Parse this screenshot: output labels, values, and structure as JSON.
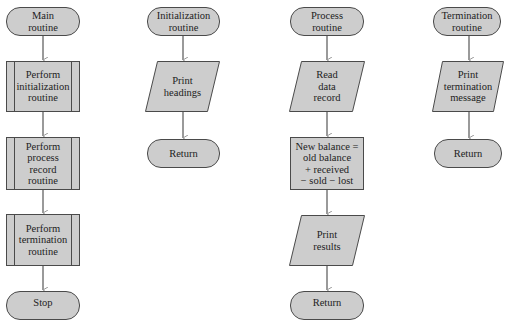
{
  "diagram": {
    "colors": {
      "fill": "#cdcdcd",
      "stroke": "#4a4a4a",
      "arrow": "#9a9a9a"
    },
    "main": {
      "start": "Main\nroutine",
      "step1": "Perform\ninitialization\nroutine",
      "step2": "Perform\nprocess\nrecord\nroutine",
      "step3": "Perform\ntermination\nroutine",
      "end": "Stop"
    },
    "initialization": {
      "start": "Initialization\nroutine",
      "step1": "Print\nheadings",
      "end": "Return"
    },
    "process": {
      "start": "Process\nroutine",
      "step1": "Read\ndata\nrecord",
      "step2": "New balance =\nold balance\n+ received\n− sold − lost",
      "step3": "Print\nresults",
      "end": "Return"
    },
    "termination": {
      "start": "Termination\nroutine",
      "step1": "Print\ntermination\nmessage",
      "end": "Return"
    }
  }
}
